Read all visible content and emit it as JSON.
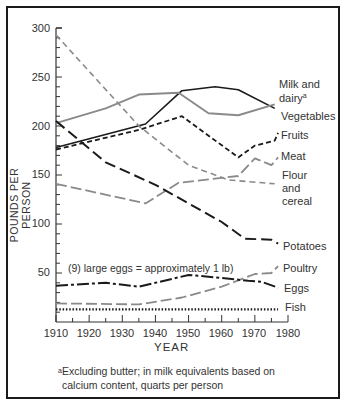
{
  "chart_data": {
    "type": "line",
    "title": "",
    "xlabel": "YEAR",
    "ylabel": "POUNDS PER PERSON",
    "xlim": [
      1910,
      1980
    ],
    "ylim": [
      0,
      300
    ],
    "xticks": [
      1910,
      1920,
      1930,
      1940,
      1950,
      1960,
      1970,
      1980
    ],
    "yticks": [
      50,
      100,
      150,
      200,
      250,
      300
    ],
    "grid": false,
    "legend_position": "inline-right",
    "annotations": [
      "(9) large eggs = approximately 1 lb)"
    ],
    "footnote": "Excluding butter; in milk equivalents based on calcium content, quarts per person",
    "series": [
      {
        "name": "Milk and dairy",
        "label_lines": [
          "Milk and",
          "dairy"
        ],
        "footnote_mark": "a",
        "style": "solid-black",
        "x": [
          1910,
          1937,
          1948,
          1958,
          1965,
          1976
        ],
        "values": [
          178,
          202,
          236,
          240,
          237,
          218
        ]
      },
      {
        "name": "Vegetables",
        "style": "solid-gray",
        "x": [
          1910,
          1925,
          1935,
          1947,
          1956,
          1965,
          1976
        ],
        "values": [
          203,
          218,
          232,
          234,
          213,
          211,
          222
        ]
      },
      {
        "name": "Fruits",
        "style": "short-dash-black",
        "x": [
          1910,
          1935,
          1948,
          1965,
          1970,
          1976,
          1977
        ],
        "values": [
          176,
          196,
          210,
          168,
          180,
          185,
          193
        ]
      },
      {
        "name": "Meat",
        "style": "long-dash-gray",
        "x": [
          1910,
          1937,
          1947,
          1960,
          1965,
          1970,
          1975,
          1977
        ],
        "values": [
          141,
          121,
          142,
          147,
          149,
          167,
          160,
          168
        ]
      },
      {
        "name": "Flour and cereal",
        "label_lines": [
          "Flour",
          "and",
          "cereal"
        ],
        "style": "dash-gray",
        "x": [
          1910,
          1935,
          1950,
          1962,
          1976
        ],
        "values": [
          293,
          200,
          160,
          145,
          141
        ]
      },
      {
        "name": "Potatoes",
        "style": "long-dash-black",
        "x": [
          1910,
          1925,
          1940,
          1960,
          1967,
          1975,
          1977
        ],
        "values": [
          205,
          163,
          140,
          102,
          85,
          84,
          80
        ]
      },
      {
        "name": "Poultry",
        "style": "long-dash-gray",
        "x": [
          1910,
          1935,
          1948,
          1960,
          1970,
          1975,
          1977
        ],
        "values": [
          19,
          18,
          25,
          36,
          49,
          50,
          57
        ]
      },
      {
        "name": "Eggs",
        "style": "dash-dot-black",
        "x": [
          1910,
          1925,
          1935,
          1950,
          1960,
          1968,
          1972,
          1977
        ],
        "values": [
          37,
          40,
          36,
          48,
          45,
          42,
          41,
          35
        ]
      },
      {
        "name": "Fish",
        "style": "dotted-black",
        "x": [
          1910,
          1977
        ],
        "values": [
          13,
          13
        ]
      }
    ]
  },
  "labels": {
    "milk_line1": "Milk and",
    "milk_line2": "dairy",
    "milk_mark": "a",
    "vegetables": "Vegetables",
    "fruits": "Fruits",
    "meat": "Meat",
    "flour_line1": "Flour",
    "flour_line2": "and",
    "flour_line3": "cereal",
    "potatoes": "Potatoes",
    "poultry": "Poultry",
    "eggs": "Eggs",
    "fish": "Fish",
    "eggs_note": "(9) large eggs = approximately 1 lb)",
    "xtitle": "YEAR",
    "ytitle": "POUNDS PER PERSON",
    "footnote_mark": "a",
    "footnote_line1": "Excluding butter; in milk equivalents based on",
    "footnote_line2": "calcium content, quarts per person"
  },
  "ticks": {
    "y": [
      "300",
      "250",
      "200",
      "150",
      "100",
      "50"
    ],
    "x": [
      "1910",
      "1920",
      "1930",
      "1940",
      "1950",
      "1960",
      "1970",
      "1980"
    ]
  }
}
